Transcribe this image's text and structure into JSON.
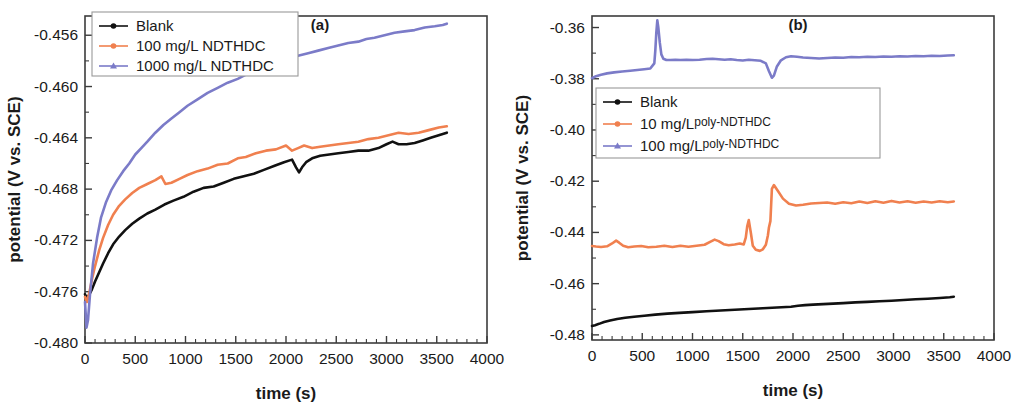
{
  "figure": {
    "panels": [
      {
        "tag": "(a)",
        "xlabel": "time (s)",
        "ylabel": "potential (V vs. SCE)"
      },
      {
        "tag": "(b)",
        "xlabel": "time (s)",
        "ylabel": "potential (V vs. SCE)"
      }
    ]
  },
  "chart_data": [
    {
      "type": "line",
      "title": "(a)",
      "xlabel": "time (s)",
      "ylabel": "potential (V vs. SCE)",
      "xlim": [
        0,
        4000
      ],
      "ylim": [
        -0.48,
        -0.4545
      ],
      "xticks": [
        0,
        500,
        1000,
        1500,
        2000,
        2500,
        3000,
        3500,
        4000
      ],
      "xticklabels": [
        "0",
        "500",
        "1000",
        "1500",
        "2000",
        "2500",
        "3000",
        "3500",
        "4000"
      ],
      "yticks": [
        -0.456,
        -0.46,
        -0.464,
        -0.468,
        -0.472,
        -0.476,
        -0.48
      ],
      "yticklabels": [
        "-0.456",
        "-0.460",
        "-0.464",
        "-0.468",
        "-0.472",
        "-0.476",
        "-0.480"
      ],
      "grid": false,
      "legend_position": "top-left",
      "series": [
        {
          "name": "Blank",
          "color": "#111111",
          "marker": "circle",
          "x": [
            0,
            20,
            45,
            70,
            100,
            140,
            180,
            230,
            280,
            340,
            400,
            470,
            540,
            620,
            700,
            790,
            880,
            980,
            1080,
            1180,
            1280,
            1380,
            1480,
            1580,
            1680,
            1780,
            1880,
            1980,
            2060,
            2100,
            2130,
            2160,
            2200,
            2260,
            2340,
            2430,
            2520,
            2620,
            2720,
            2820,
            2920,
            3000,
            3060,
            3120,
            3200,
            3280,
            3360,
            3440,
            3520,
            3600
          ],
          "y": [
            -0.4762,
            -0.4765,
            -0.4762,
            -0.4758,
            -0.4752,
            -0.4745,
            -0.4738,
            -0.473,
            -0.4723,
            -0.4717,
            -0.4712,
            -0.4707,
            -0.4703,
            -0.4699,
            -0.4696,
            -0.4692,
            -0.4689,
            -0.4686,
            -0.4682,
            -0.4679,
            -0.4678,
            -0.4675,
            -0.4672,
            -0.467,
            -0.4668,
            -0.4665,
            -0.4662,
            -0.4659,
            -0.4657,
            -0.4663,
            -0.4667,
            -0.4663,
            -0.4659,
            -0.4656,
            -0.4654,
            -0.4653,
            -0.4652,
            -0.4651,
            -0.465,
            -0.465,
            -0.4648,
            -0.4645,
            -0.4643,
            -0.4645,
            -0.4645,
            -0.4644,
            -0.4642,
            -0.464,
            -0.4638,
            -0.4636
          ]
        },
        {
          "name": "100 mg/L NDTHDC",
          "color": "#F0804F",
          "marker": "circle",
          "x": [
            0,
            20,
            45,
            70,
            100,
            140,
            180,
            230,
            280,
            340,
            400,
            470,
            540,
            620,
            700,
            760,
            800,
            860,
            940,
            1020,
            1120,
            1220,
            1320,
            1420,
            1520,
            1600,
            1700,
            1800,
            1900,
            2000,
            2060,
            2120,
            2180,
            2260,
            2340,
            2430,
            2520,
            2620,
            2720,
            2820,
            2920,
            3020,
            3120,
            3220,
            3320,
            3420,
            3520,
            3600
          ],
          "y": [
            -0.4764,
            -0.4768,
            -0.476,
            -0.475,
            -0.474,
            -0.4728,
            -0.4718,
            -0.4708,
            -0.47,
            -0.4693,
            -0.4688,
            -0.4683,
            -0.4679,
            -0.4676,
            -0.4673,
            -0.467,
            -0.4676,
            -0.4675,
            -0.4672,
            -0.4669,
            -0.4666,
            -0.4664,
            -0.4661,
            -0.466,
            -0.4656,
            -0.4655,
            -0.4652,
            -0.465,
            -0.4649,
            -0.4646,
            -0.465,
            -0.4648,
            -0.4646,
            -0.4648,
            -0.4647,
            -0.4646,
            -0.4645,
            -0.4644,
            -0.4643,
            -0.4641,
            -0.464,
            -0.4638,
            -0.4636,
            -0.4637,
            -0.4636,
            -0.4634,
            -0.4632,
            -0.4631
          ]
        },
        {
          "name": "1000 mg/L NDTHDC",
          "color": "#7B7BC8",
          "marker": "triangle",
          "x": [
            0,
            15,
            30,
            50,
            80,
            120,
            160,
            210,
            260,
            320,
            380,
            440,
            500,
            560,
            620,
            700,
            780,
            860,
            940,
            1020,
            1120,
            1220,
            1320,
            1420,
            1520,
            1620,
            1720,
            1820,
            1920,
            2020,
            2120,
            2220,
            2320,
            2420,
            2520,
            2620,
            2720,
            2800,
            2880,
            2980,
            3080,
            3180,
            3280,
            3380,
            3480,
            3560,
            3600
          ],
          "y": [
            -0.4768,
            -0.4788,
            -0.4782,
            -0.4762,
            -0.4738,
            -0.4718,
            -0.4702,
            -0.469,
            -0.4681,
            -0.4673,
            -0.4666,
            -0.466,
            -0.4653,
            -0.4648,
            -0.4643,
            -0.4636,
            -0.463,
            -0.4625,
            -0.462,
            -0.4615,
            -0.461,
            -0.4605,
            -0.4601,
            -0.4597,
            -0.4594,
            -0.459,
            -0.4587,
            -0.4584,
            -0.4581,
            -0.4578,
            -0.4576,
            -0.4574,
            -0.4572,
            -0.457,
            -0.4568,
            -0.4566,
            -0.4565,
            -0.4563,
            -0.4562,
            -0.456,
            -0.4558,
            -0.4557,
            -0.4556,
            -0.4554,
            -0.4553,
            -0.4552,
            -0.4551
          ]
        }
      ]
    },
    {
      "type": "line",
      "title": "(b)",
      "xlabel": "time (s)",
      "ylabel": "potential (V vs. SCE)",
      "xlim": [
        0,
        4000
      ],
      "ylim": [
        -0.482,
        -0.3555
      ],
      "xticks": [
        0,
        500,
        1000,
        1500,
        2000,
        2500,
        3000,
        3500,
        4000
      ],
      "xticklabels": [
        "0",
        "500",
        "1000",
        "1500",
        "2000",
        "2500",
        "3000",
        "3500",
        "4000"
      ],
      "yticks": [
        -0.36,
        -0.38,
        -0.4,
        -0.42,
        -0.44,
        -0.46,
        -0.48
      ],
      "yticklabels": [
        "-0.36",
        "-0.38",
        "-0.40",
        "-0.42",
        "-0.44",
        "-0.46",
        "-0.48"
      ],
      "grid": false,
      "legend_position": "center-left",
      "series": [
        {
          "name": "Blank",
          "color": "#111111",
          "marker": "circle",
          "x": [
            0,
            30,
            70,
            120,
            180,
            250,
            330,
            420,
            520,
            630,
            750,
            870,
            1000,
            1140,
            1280,
            1420,
            1560,
            1700,
            1840,
            1980,
            2050,
            2120,
            2200,
            2300,
            2400,
            2500,
            2620,
            2740,
            2860,
            2980,
            3100,
            3220,
            3340,
            3460,
            3560,
            3600
          ],
          "y": [
            -0.4765,
            -0.4762,
            -0.4757,
            -0.475,
            -0.4744,
            -0.4738,
            -0.4733,
            -0.4729,
            -0.4725,
            -0.4721,
            -0.4717,
            -0.4714,
            -0.4711,
            -0.4708,
            -0.4705,
            -0.4702,
            -0.4699,
            -0.4696,
            -0.4693,
            -0.469,
            -0.4686,
            -0.4684,
            -0.4682,
            -0.468,
            -0.4678,
            -0.4676,
            -0.4673,
            -0.4671,
            -0.4669,
            -0.4667,
            -0.4664,
            -0.4661,
            -0.4659,
            -0.4656,
            -0.4653,
            -0.4651
          ]
        },
        {
          "name": "10 mg/L poly-NDTHDC",
          "color": "#F0804F",
          "marker": "circle",
          "x": [
            0,
            40,
            90,
            150,
            200,
            240,
            270,
            310,
            360,
            420,
            490,
            560,
            640,
            720,
            800,
            880,
            960,
            1040,
            1120,
            1180,
            1220,
            1260,
            1310,
            1360,
            1420,
            1470,
            1510,
            1530,
            1545,
            1560,
            1580,
            1600,
            1630,
            1670,
            1700,
            1730,
            1750,
            1760,
            1775,
            1790,
            1810,
            1850,
            1900,
            1960,
            2030,
            2100,
            2180,
            2260,
            2340,
            2420,
            2500,
            2580,
            2660,
            2740,
            2820,
            2900,
            2980,
            3060,
            3140,
            3220,
            3300,
            3380,
            3460,
            3540,
            3600
          ],
          "y": [
            -0.4453,
            -0.4455,
            -0.4457,
            -0.4454,
            -0.4443,
            -0.4432,
            -0.444,
            -0.4452,
            -0.4458,
            -0.4455,
            -0.4453,
            -0.4458,
            -0.4456,
            -0.4452,
            -0.4457,
            -0.4452,
            -0.4456,
            -0.4452,
            -0.4448,
            -0.4436,
            -0.4428,
            -0.4434,
            -0.4446,
            -0.445,
            -0.4447,
            -0.4443,
            -0.4447,
            -0.442,
            -0.4375,
            -0.4352,
            -0.44,
            -0.4452,
            -0.4468,
            -0.4472,
            -0.4466,
            -0.4448,
            -0.4412,
            -0.4382,
            -0.4356,
            -0.423,
            -0.4215,
            -0.4238,
            -0.4268,
            -0.4288,
            -0.4295,
            -0.4292,
            -0.4287,
            -0.4285,
            -0.4283,
            -0.4288,
            -0.4282,
            -0.4286,
            -0.4279,
            -0.4285,
            -0.4278,
            -0.4284,
            -0.4277,
            -0.4283,
            -0.4278,
            -0.4284,
            -0.4279,
            -0.4283,
            -0.4278,
            -0.4282,
            -0.4279
          ]
        },
        {
          "name": "100 mg/L poly-NDTHDC",
          "color": "#7B7BC8",
          "marker": "triangle",
          "x": [
            0,
            40,
            90,
            150,
            220,
            300,
            380,
            450,
            520,
            580,
            620,
            630,
            640,
            650,
            660,
            675,
            690,
            710,
            740,
            780,
            830,
            880,
            940,
            1000,
            1070,
            1140,
            1200,
            1260,
            1320,
            1380,
            1440,
            1500,
            1560,
            1620,
            1680,
            1730,
            1760,
            1790,
            1810,
            1840,
            1880,
            1930,
            1980,
            2040,
            2100,
            2180,
            2260,
            2340,
            2420,
            2500,
            2580,
            2660,
            2740,
            2820,
            2900,
            2980,
            3060,
            3140,
            3220,
            3300,
            3380,
            3460,
            3540,
            3600
          ],
          "y": [
            -0.3798,
            -0.379,
            -0.3784,
            -0.3779,
            -0.3775,
            -0.3772,
            -0.3769,
            -0.3766,
            -0.3763,
            -0.376,
            -0.374,
            -0.369,
            -0.362,
            -0.3572,
            -0.36,
            -0.366,
            -0.3705,
            -0.3722,
            -0.3727,
            -0.3727,
            -0.3726,
            -0.3727,
            -0.3726,
            -0.3727,
            -0.3726,
            -0.3723,
            -0.3722,
            -0.3724,
            -0.3726,
            -0.3724,
            -0.3727,
            -0.3729,
            -0.3726,
            -0.3728,
            -0.373,
            -0.374,
            -0.377,
            -0.3796,
            -0.3788,
            -0.3752,
            -0.3728,
            -0.3716,
            -0.3712,
            -0.3714,
            -0.3717,
            -0.3719,
            -0.3721,
            -0.3719,
            -0.3717,
            -0.3718,
            -0.3715,
            -0.3716,
            -0.3714,
            -0.3715,
            -0.3713,
            -0.3714,
            -0.3712,
            -0.3713,
            -0.3711,
            -0.3712,
            -0.371,
            -0.3711,
            -0.3709,
            -0.3708
          ]
        }
      ]
    }
  ]
}
